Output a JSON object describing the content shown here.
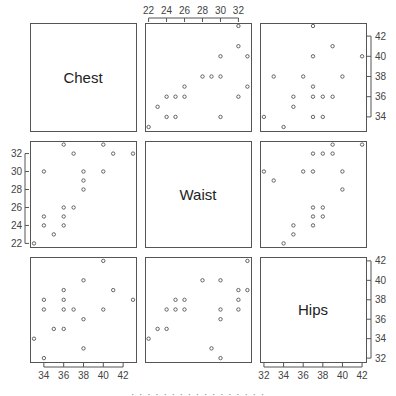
{
  "chart_data": {
    "type": "scatter",
    "subtype": "scatterplot-matrix",
    "title": "",
    "variables": [
      "Chest",
      "Waist",
      "Hips"
    ],
    "ranges": {
      "Chest": [
        33,
        43
      ],
      "Waist": [
        22,
        33
      ],
      "Hips": [
        32,
        42
      ]
    },
    "ticks": {
      "Chest": [
        34,
        36,
        38,
        40,
        42
      ],
      "Waist": [
        22,
        24,
        26,
        28,
        30,
        32
      ],
      "Hips": [
        32,
        34,
        36,
        38,
        40,
        42
      ]
    },
    "axis_positions": {
      "top": {
        "column_2": "Waist"
      },
      "right": {
        "row_1": "Chest",
        "row_3": "Hips"
      },
      "left": {
        "row_2": "Waist"
      },
      "bottom": {
        "column_1": "Chest",
        "column_3": "Hips"
      }
    },
    "grid": false,
    "legend": null,
    "panels": [
      {
        "row": 1,
        "col": 2,
        "x_var": "Waist",
        "y_var": "Chest",
        "points": [
          [
            22,
            33
          ],
          [
            23,
            35
          ],
          [
            24,
            34
          ],
          [
            24,
            36
          ],
          [
            25,
            34
          ],
          [
            25,
            36
          ],
          [
            26,
            36
          ],
          [
            26,
            37
          ],
          [
            28,
            38
          ],
          [
            29,
            38
          ],
          [
            30,
            34
          ],
          [
            30,
            38
          ],
          [
            30,
            40
          ],
          [
            32,
            36
          ],
          [
            32,
            41
          ],
          [
            32,
            43
          ],
          [
            33,
            37
          ],
          [
            33,
            40
          ]
        ]
      },
      {
        "row": 1,
        "col": 3,
        "x_var": "Hips",
        "y_var": "Chest",
        "points": [
          [
            32,
            34
          ],
          [
            33,
            38
          ],
          [
            34,
            33
          ],
          [
            35,
            35
          ],
          [
            35,
            36
          ],
          [
            36,
            38
          ],
          [
            37,
            34
          ],
          [
            37,
            36
          ],
          [
            37,
            37
          ],
          [
            37,
            40
          ],
          [
            37,
            43
          ],
          [
            38,
            34
          ],
          [
            38,
            36
          ],
          [
            39,
            36
          ],
          [
            39,
            41
          ],
          [
            40,
            38
          ],
          [
            42,
            40
          ]
        ]
      },
      {
        "row": 2,
        "col": 1,
        "x_var": "Chest",
        "y_var": "Waist",
        "points": [
          [
            33,
            22
          ],
          [
            34,
            24
          ],
          [
            34,
            25
          ],
          [
            34,
            30
          ],
          [
            35,
            23
          ],
          [
            36,
            24
          ],
          [
            36,
            25
          ],
          [
            36,
            26
          ],
          [
            36,
            33
          ],
          [
            37,
            26
          ],
          [
            37,
            32
          ],
          [
            38,
            28
          ],
          [
            38,
            29
          ],
          [
            38,
            30
          ],
          [
            40,
            30
          ],
          [
            40,
            33
          ],
          [
            41,
            32
          ],
          [
            43,
            32
          ]
        ]
      },
      {
        "row": 2,
        "col": 3,
        "x_var": "Hips",
        "y_var": "Waist",
        "points": [
          [
            32,
            30
          ],
          [
            33,
            29
          ],
          [
            34,
            22
          ],
          [
            35,
            23
          ],
          [
            35,
            24
          ],
          [
            36,
            30
          ],
          [
            37,
            24
          ],
          [
            37,
            25
          ],
          [
            37,
            26
          ],
          [
            37,
            30
          ],
          [
            37,
            32
          ],
          [
            38,
            25
          ],
          [
            38,
            26
          ],
          [
            38,
            32
          ],
          [
            39,
            32
          ],
          [
            39,
            33
          ],
          [
            40,
            28
          ],
          [
            40,
            30
          ],
          [
            42,
            33
          ]
        ]
      },
      {
        "row": 3,
        "col": 1,
        "x_var": "Chest",
        "y_var": "Hips",
        "points": [
          [
            33,
            34
          ],
          [
            34,
            32
          ],
          [
            34,
            37
          ],
          [
            34,
            38
          ],
          [
            35,
            35
          ],
          [
            36,
            35
          ],
          [
            36,
            37
          ],
          [
            36,
            38
          ],
          [
            36,
            39
          ],
          [
            37,
            37
          ],
          [
            38,
            33
          ],
          [
            38,
            36
          ],
          [
            38,
            40
          ],
          [
            40,
            37
          ],
          [
            40,
            42
          ],
          [
            41,
            39
          ],
          [
            43,
            38
          ]
        ]
      },
      {
        "row": 3,
        "col": 2,
        "x_var": "Waist",
        "y_var": "Hips",
        "points": [
          [
            22,
            34
          ],
          [
            23,
            35
          ],
          [
            24,
            35
          ],
          [
            24,
            37
          ],
          [
            25,
            37
          ],
          [
            25,
            38
          ],
          [
            26,
            37
          ],
          [
            26,
            38
          ],
          [
            28,
            40
          ],
          [
            29,
            33
          ],
          [
            30,
            32
          ],
          [
            30,
            36
          ],
          [
            30,
            37
          ],
          [
            30,
            40
          ],
          [
            32,
            37
          ],
          [
            32,
            38
          ],
          [
            32,
            39
          ],
          [
            33,
            39
          ],
          [
            33,
            42
          ]
        ]
      }
    ]
  },
  "labels": {
    "diag_1": "Chest",
    "diag_2": "Waist",
    "diag_3": "Hips"
  },
  "caption_fragment": "· · · · · ·   · · · · ·   · ·   · · · ·"
}
